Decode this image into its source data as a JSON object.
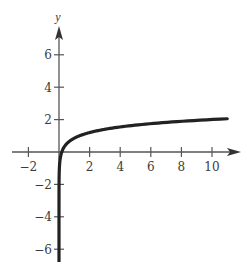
{
  "chart_data": {
    "type": "line",
    "title": "",
    "xlabel": "",
    "ylabel": "y",
    "xlim": [
      -3,
      11.5
    ],
    "ylim": [
      -7,
      8
    ],
    "grid": false,
    "legend": null,
    "x_ticks": [
      -2,
      2,
      4,
      6,
      8,
      10
    ],
    "y_ticks": [
      6,
      4,
      2,
      -2,
      -4,
      -6
    ],
    "x_tick_labels": [
      "−2",
      "2",
      "4",
      "6",
      "8",
      "10"
    ],
    "y_tick_labels": [
      "6",
      "4",
      "2",
      "−2",
      "−4",
      "−6"
    ],
    "series": [
      {
        "name": "curve",
        "description": "logarithmic-shaped curve, vertical asymptote at x = 0, increasing slowly",
        "x": [
          0.01,
          0.05,
          0.1,
          0.25,
          0.5,
          1,
          2,
          4,
          6,
          8,
          10,
          11
        ],
        "y": [
          -1.45,
          -0.64,
          -0.3,
          0.16,
          0.51,
          0.85,
          1.2,
          1.55,
          1.75,
          1.89,
          2.0,
          2.05
        ]
      }
    ],
    "axis_arrows": {
      "x": true,
      "y": true
    },
    "colors": {
      "axis": "#555555",
      "curve": "#222222",
      "text": "#3a3a3a"
    }
  }
}
